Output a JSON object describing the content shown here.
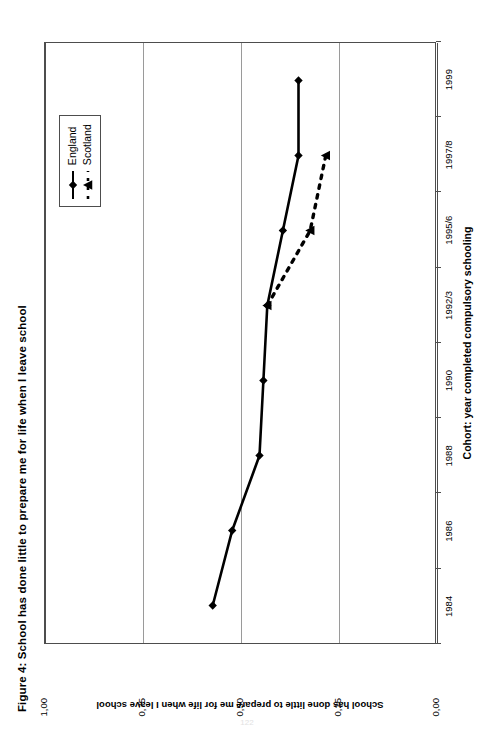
{
  "figure": {
    "title": "Figure 4: School has done little to prepare me for life when I leave school",
    "page_number": "122"
  },
  "legend": {
    "position": "inside-top-right",
    "entries": [
      {
        "label": "England",
        "marker": "diamond",
        "line": "solid",
        "color": "#000000"
      },
      {
        "label": "Scotland",
        "marker": "triangle",
        "line": "dashed",
        "color": "#000000"
      }
    ]
  },
  "chart_data": {
    "type": "line",
    "title": "Figure 4: School has done little to prepare me for life when I leave school",
    "xlabel": "Cohort: year completed compulsory schooling",
    "ylabel": "School has done little to prepare me for life when I leave school",
    "categories": [
      "1984",
      "1986",
      "1988",
      "1990",
      "1992/3",
      "1995/6",
      "1997/8",
      "1999"
    ],
    "ylim": [
      0.0,
      1.0
    ],
    "ytick_labels": [
      "0,00",
      "0,25",
      "0,50",
      "0,75",
      "1,00"
    ],
    "ytick_values": [
      0.0,
      0.25,
      0.5,
      0.75,
      1.0
    ],
    "grid": "horizontal-value-gridlines",
    "series": [
      {
        "name": "England",
        "marker": "diamond",
        "line": "solid",
        "values": [
          0.57,
          0.52,
          0.45,
          0.44,
          0.43,
          0.39,
          0.35,
          0.35
        ]
      },
      {
        "name": "Scotland",
        "marker": "triangle",
        "line": "dashed",
        "values": [
          null,
          null,
          null,
          null,
          0.43,
          0.32,
          0.28,
          null
        ]
      }
    ]
  }
}
